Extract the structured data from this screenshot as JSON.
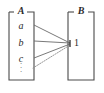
{
  "figure": {
    "kind": "set-mapping-diagram",
    "background_color": "#ffffff",
    "stroke_color": "#4a4a4a",
    "text_color": "#2b2b2b"
  },
  "set_a": {
    "label": "A",
    "elements": [
      {
        "name": "a",
        "text": "a"
      },
      {
        "name": "b",
        "text": "b"
      },
      {
        "name": "c",
        "text": "c"
      }
    ],
    "ellipsis": "⋮",
    "ellipsis_dots": [
      "·",
      "·",
      "·"
    ]
  },
  "set_b": {
    "label": "B",
    "elements": [
      {
        "name": "one",
        "text": "1"
      }
    ]
  },
  "mappings": [
    {
      "from": "a",
      "to": "1",
      "style": "solid"
    },
    {
      "from": "b",
      "to": "1",
      "style": "solid"
    },
    {
      "from": "c",
      "to": "1",
      "style": "solid"
    },
    {
      "from": "ellipsis",
      "to": "1",
      "style": "dotted"
    }
  ]
}
